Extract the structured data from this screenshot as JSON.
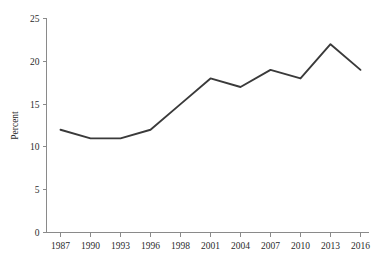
{
  "chart_data": {
    "type": "line",
    "title": "",
    "subtitle": "",
    "xlabel": "",
    "ylabel": "Percent",
    "categories": [
      "1987",
      "1990",
      "1993",
      "1996",
      "1998",
      "2001",
      "2004",
      "2007",
      "2010",
      "2013",
      "2016"
    ],
    "values": [
      12,
      11,
      11,
      12,
      15,
      18,
      17,
      19,
      18,
      22,
      19
    ],
    "series": [
      {
        "name": "Percent",
        "values": [
          12,
          11,
          11,
          12,
          15,
          18,
          17,
          19,
          18,
          22,
          19
        ]
      }
    ],
    "xtick_labels": [
      "1987",
      "1990",
      "1993",
      "1996",
      "1998",
      "2001",
      "2004",
      "2007",
      "2010",
      "2013",
      "2016"
    ],
    "ytick_labels": [
      "0",
      "5",
      "10",
      "15",
      "20",
      "25"
    ],
    "ytick_values": [
      0,
      5,
      10,
      15,
      20,
      25
    ],
    "ylim": [
      0,
      25
    ],
    "grid": false,
    "legend": false,
    "legend_position": "none",
    "line_color": "#3a3a3a",
    "axis_color": "#8a8a8a",
    "background_color": "#ffffff",
    "annotations": []
  }
}
